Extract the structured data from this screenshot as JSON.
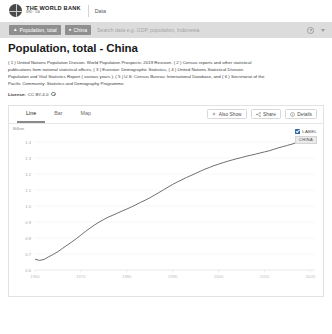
{
  "brand": {
    "logo_icon": "globe-icon",
    "name_line1": "THE WORLD BANK",
    "name_line2": "IBRD · IDA",
    "section": "Data"
  },
  "search": {
    "indicator_pill": "Population, total",
    "indicator_icon": "chart-icon",
    "country_pill": "China",
    "country_icon": "map-pin-icon",
    "placeholder": "Search data e.g. GDP, population, Indonesia",
    "value": "",
    "settings_icon": "gear-icon",
    "caret_icon": "chevron-down-icon"
  },
  "page": {
    "title": "Population, total - China",
    "description_lines": [
      "( 1 ) United Nations Population Division. World Population Prospects: 2019 Revision. ( 2 ) Census reports and other statistical",
      "publications from national statistical offices, ( 3 ) Eurostat: Demographic Statistics, ( 4 ) United Nations Statistical Division.",
      "Population and Vital Statistics Report ( various years ), ( 5 ) U.S. Census Bureau: International Database, and ( 6 ) Secretariat of the",
      "Pacific Community: Statistics and Demography Programme."
    ],
    "license_label": "License:",
    "license_value": "CC BY-4.0",
    "license_info_icon": "info-icon"
  },
  "card": {
    "tabs": [
      {
        "label": "Line",
        "active": true
      },
      {
        "label": "Bar",
        "active": false
      },
      {
        "label": "Map",
        "active": false
      }
    ],
    "buttons": [
      {
        "label": "Also Show",
        "icon": "plus-icon"
      },
      {
        "label": "Share",
        "icon": "share-icon"
      },
      {
        "label": "Details",
        "icon": "info-icon"
      }
    ]
  },
  "legend": {
    "label_checkbox": "LABEL",
    "label_checked": true,
    "series_tag": "CHINA",
    "accent": "#2f6ba5"
  },
  "chart_data": {
    "type": "line",
    "title": "Population, total - China",
    "xlabel": "",
    "ylabel": "Billion",
    "unit": "Billion",
    "grid": true,
    "legend_position": "top-right",
    "line_color": "#4a4a4a",
    "xlim": [
      1960,
      2021
    ],
    "ylim": [
      0.6,
      1.45
    ],
    "yticks": [
      1.4,
      1.3,
      1.2,
      1.1,
      1.0,
      0.9,
      0.8,
      0.7,
      0.6
    ],
    "ytick_labels": [
      "1.4",
      "1.3",
      "1.2",
      "1.1",
      "1.0",
      "0.9",
      "0.8",
      "0.7",
      "0.6"
    ],
    "xticks": [
      1960,
      1970,
      1980,
      1990,
      2000,
      2010,
      2020
    ],
    "xtick_labels": [
      "1960",
      "1970",
      "1980",
      "1990",
      "2000",
      "2010",
      "2020"
    ],
    "series": [
      {
        "name": "CHINA",
        "x": [
          1960,
          1961,
          1962,
          1963,
          1964,
          1965,
          1966,
          1967,
          1968,
          1969,
          1970,
          1971,
          1972,
          1973,
          1974,
          1975,
          1976,
          1977,
          1978,
          1979,
          1980,
          1981,
          1982,
          1983,
          1984,
          1985,
          1986,
          1987,
          1988,
          1989,
          1990,
          1991,
          1992,
          1993,
          1994,
          1995,
          1996,
          1997,
          1998,
          1999,
          2000,
          2001,
          2002,
          2003,
          2004,
          2005,
          2006,
          2007,
          2008,
          2009,
          2010,
          2011,
          2012,
          2013,
          2014,
          2015,
          2016,
          2017,
          2018,
          2019,
          2020
        ],
        "values": [
          0.667,
          0.66,
          0.666,
          0.683,
          0.698,
          0.715,
          0.735,
          0.755,
          0.775,
          0.796,
          0.818,
          0.841,
          0.862,
          0.882,
          0.9,
          0.916,
          0.931,
          0.943,
          0.956,
          0.969,
          0.981,
          0.994,
          1.008,
          1.023,
          1.036,
          1.051,
          1.067,
          1.084,
          1.101,
          1.118,
          1.135,
          1.15,
          1.164,
          1.178,
          1.191,
          1.204,
          1.217,
          1.23,
          1.241,
          1.252,
          1.262,
          1.271,
          1.28,
          1.288,
          1.296,
          1.303,
          1.311,
          1.317,
          1.324,
          1.331,
          1.338,
          1.345,
          1.354,
          1.363,
          1.371,
          1.379,
          1.387,
          1.396,
          1.403,
          1.408,
          1.411
        ]
      }
    ]
  }
}
